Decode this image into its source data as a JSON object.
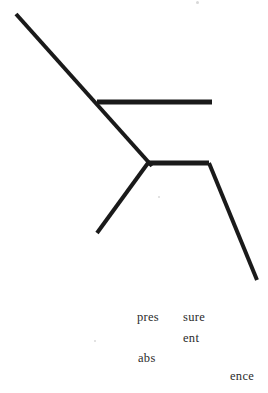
{
  "page": {
    "background_color": "#ffffff",
    "width": 268,
    "height": 393
  },
  "figure": {
    "name": "zigzag-line-drawing",
    "stroke_color": "#1a1a1a",
    "stroke_width": 4,
    "strokes": [
      {
        "name": "upper-left-diagonal",
        "points": "16,14 152,166"
      },
      {
        "name": "upper-horizontal-bar",
        "points": "97,102 212,102"
      },
      {
        "name": "lower-horizontal-bar",
        "points": "148,163 209,163"
      },
      {
        "name": "lower-left-branch",
        "points": "148,163 97,233"
      },
      {
        "name": "lower-right-diagonal",
        "points": "209,163 257,280"
      }
    ]
  },
  "text_fragments": [
    {
      "name": "fragment-pres",
      "text": "pres",
      "x": 137,
      "y": 311
    },
    {
      "name": "fragment-sure",
      "text": "sure",
      "x": 183,
      "y": 311
    },
    {
      "name": "fragment-ent",
      "text": "ent",
      "x": 183,
      "y": 332
    },
    {
      "name": "fragment-abs",
      "text": "abs",
      "x": 138,
      "y": 352
    },
    {
      "name": "fragment-ence",
      "text": "ence",
      "x": 230,
      "y": 370
    }
  ],
  "artifacts": [
    {
      "name": "scan-speck-top",
      "x": 196,
      "y": 1,
      "size": 3
    },
    {
      "name": "scan-speck-middle",
      "x": 158,
      "y": 196,
      "size": 2
    },
    {
      "name": "scan-speck-left",
      "x": 94,
      "y": 340,
      "size": 2
    }
  ]
}
